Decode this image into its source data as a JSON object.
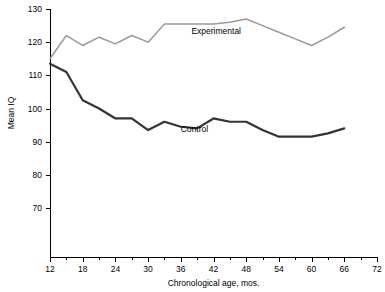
{
  "chart_data": {
    "type": "line",
    "title": "",
    "xlabel": "Chronological age, mos.",
    "ylabel": "Mean IQ",
    "xlim": [
      12,
      72
    ],
    "ylim": [
      62,
      130
    ],
    "grid": false,
    "legend_position": "inline-annotation",
    "x_ticks": [
      12,
      18,
      24,
      30,
      36,
      42,
      48,
      54,
      60,
      66,
      72
    ],
    "x_tick_labels": [
      "12",
      "18",
      "24",
      "30",
      "36",
      "42",
      "48",
      "54",
      "60",
      "66",
      "72"
    ],
    "x_minor_ticks": [
      15,
      21,
      27,
      33,
      39,
      45,
      51,
      57,
      63,
      69
    ],
    "y_ticks": [
      70,
      80,
      90,
      100,
      110,
      120,
      130
    ],
    "y_tick_labels": [
      "70",
      "80",
      "90",
      "100",
      "110",
      "120",
      "130"
    ],
    "x": [
      12,
      15,
      18,
      21,
      24,
      27,
      30,
      33,
      36,
      39,
      42,
      45,
      48,
      51,
      54,
      57,
      60,
      63,
      66
    ],
    "series": [
      {
        "name": "Experimental",
        "color": "#9a9a9a",
        "width": 1.5,
        "label_x": 42.5,
        "label_y": 122.5,
        "values": [
          115.0,
          122.0,
          119.0,
          121.5,
          119.5,
          122.0,
          120.0,
          125.5,
          125.5,
          125.5,
          125.5,
          126.0,
          127.0,
          125.0,
          123.0,
          121.0,
          119.0,
          121.5,
          124.5
        ]
      },
      {
        "name": "Control",
        "color": "#333333",
        "width": 2.2,
        "label_x": 38.5,
        "label_y": 93.0,
        "values": [
          113.5,
          111.0,
          102.5,
          100.0,
          97.0,
          97.0,
          93.5,
          96.0,
          94.5,
          94.0,
          97.0,
          96.0,
          96.0,
          93.5,
          91.5,
          91.5,
          91.5,
          92.5,
          94.0
        ]
      }
    ]
  }
}
